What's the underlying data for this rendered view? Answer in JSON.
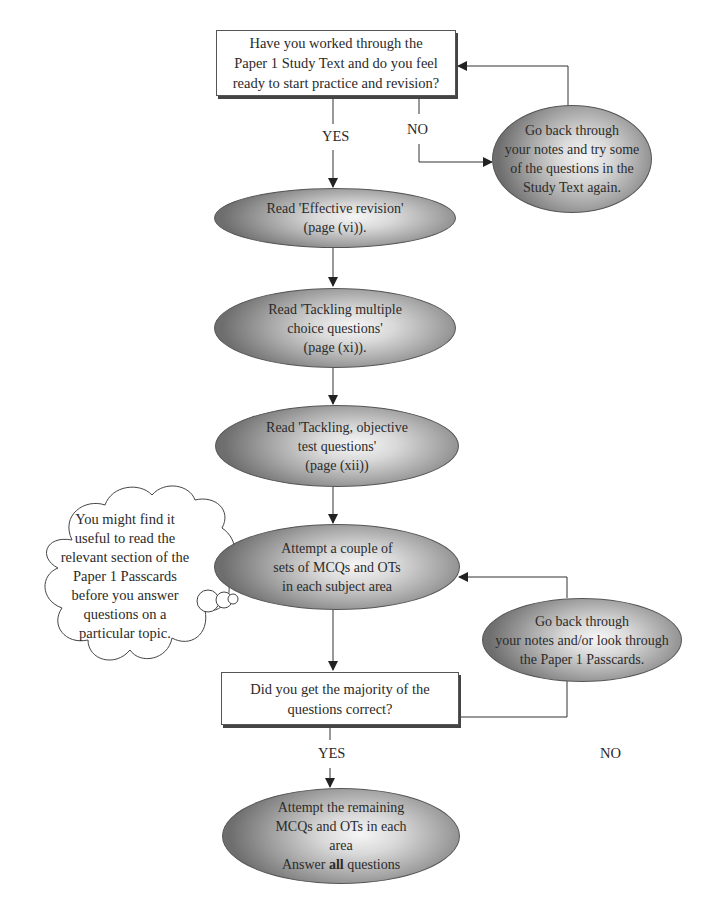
{
  "start_box": {
    "lines": [
      "Have you worked through the",
      "Paper 1 Study Text and do you feel",
      "ready to start practice and revision?"
    ]
  },
  "labels": {
    "yes_1": "YES",
    "no_1": "NO",
    "yes_2": "YES",
    "no_2": "NO"
  },
  "go_back_1": {
    "lines": [
      "Go back through",
      "your notes and try some",
      "of the questions in the",
      "Study Text again."
    ]
  },
  "step_effective_revision": {
    "lines": [
      "Read 'Effective revision'",
      "(page (vi))."
    ]
  },
  "step_mcq": {
    "lines": [
      "Read 'Tackling multiple",
      "choice questions'",
      "(page (xi))."
    ]
  },
  "step_ot": {
    "lines": [
      "Read 'Tackling, objective",
      "test questions'",
      "(page (xii))"
    ]
  },
  "step_attempt": {
    "lines": [
      "Attempt a couple of",
      "sets of MCQs and OTs",
      "in each subject area"
    ]
  },
  "cloud": {
    "lines": [
      "You might find it",
      "useful to read the",
      "relevant section of the",
      "Paper 1 Passcards",
      "before you answer",
      "questions on a",
      "particular topic."
    ]
  },
  "go_back_2": {
    "lines": [
      "Go back through",
      "your notes and/or look through",
      "the Paper 1 Passcards."
    ]
  },
  "decision_box": {
    "lines": [
      "Did you get the majority of the",
      "questions correct?"
    ]
  },
  "final_step": {
    "lines": [
      "Attempt the remaining",
      "MCQs and OTs in each",
      "area"
    ],
    "last_line_prefix": "Answer ",
    "last_line_bold": "all",
    "last_line_suffix": " questions"
  }
}
